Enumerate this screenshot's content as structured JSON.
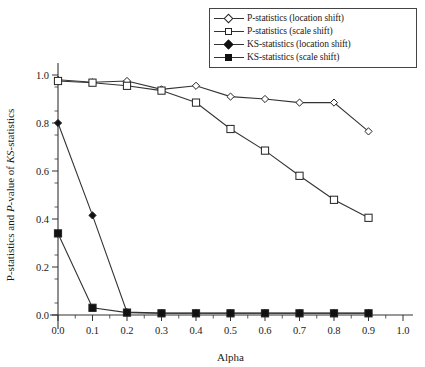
{
  "chart_data": {
    "type": "line",
    "title": "",
    "xlabel": "Alpha",
    "ylabel": "P-statistics and P-value of KS-statistics",
    "ylabel_parts": [
      {
        "text": "P-statistics and ",
        "italic": false
      },
      {
        "text": "P",
        "italic": true
      },
      {
        "text": "-value of ",
        "italic": false
      },
      {
        "text": "KS",
        "italic": true
      },
      {
        "text": "-statistics",
        "italic": false
      }
    ],
    "xlim": [
      0.0,
      1.0
    ],
    "ylim": [
      0.0,
      1.0
    ],
    "xticks": [
      0.0,
      0.1,
      0.2,
      0.3,
      0.4,
      0.5,
      0.6,
      0.7,
      0.8,
      0.9,
      1.0
    ],
    "xticklabels": [
      "0.0",
      "0.1",
      "0.2",
      "0.3",
      "0.4",
      "0.5",
      "0.6",
      "0.7",
      "0.8",
      "0.9",
      "1.0"
    ],
    "yticks": [
      0.0,
      0.2,
      0.4,
      0.6,
      0.8,
      1.0
    ],
    "yticklabels": [
      "0.0",
      "0.2",
      "0.4",
      "0.6",
      "0.8",
      "1.0"
    ],
    "x_minor_step": 0.05,
    "y_minor_step": 0.05,
    "grid": false,
    "legend_position": "top-right",
    "x": [
      0.0,
      0.1,
      0.2,
      0.3,
      0.4,
      0.5,
      0.6,
      0.7,
      0.8,
      0.9
    ],
    "series": [
      {
        "name": "P-statistics (location shift)",
        "marker": "diamond-open",
        "values": [
          0.98,
          0.97,
          0.975,
          0.94,
          0.955,
          0.91,
          0.9,
          0.885,
          0.885,
          0.765
        ]
      },
      {
        "name": "P-statistics (scale shift)",
        "marker": "square-open",
        "values": [
          0.975,
          0.968,
          0.955,
          0.935,
          0.885,
          0.775,
          0.685,
          0.58,
          0.48,
          0.405
        ]
      },
      {
        "name": "KS-statistics (location shift)",
        "marker": "diamond-filled",
        "values": [
          0.8,
          0.415,
          0.012,
          0.008,
          0.008,
          0.008,
          0.008,
          0.008,
          0.008,
          0.008
        ]
      },
      {
        "name": "KS-statistics (scale shift)",
        "marker": "square-filled",
        "values": [
          0.34,
          0.03,
          0.01,
          0.007,
          0.007,
          0.007,
          0.007,
          0.007,
          0.007,
          0.007
        ]
      }
    ]
  },
  "legend": {
    "items": [
      {
        "label": "P-statistics (location shift)",
        "marker": "diamond-open"
      },
      {
        "label": "P-statistics (scale shift)",
        "marker": "square-open"
      },
      {
        "label": "KS-statistics (location shift)",
        "marker": "diamond-filled"
      },
      {
        "label": "KS-statistics (scale shift)",
        "marker": "square-filled"
      }
    ]
  },
  "colors": {
    "line": "#333333",
    "marker_fill": "#111111",
    "marker_open": "#ffffff",
    "background": "#ffffff"
  }
}
